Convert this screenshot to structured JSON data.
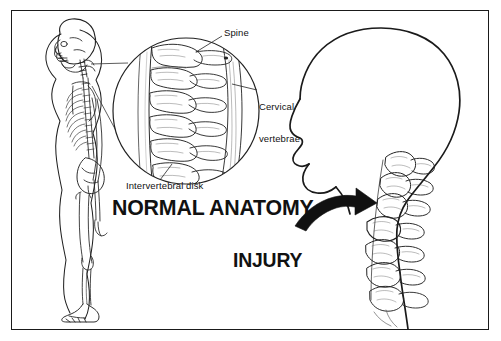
{
  "figure": {
    "background_color": "#ffffff",
    "ink_color": "#111111",
    "border_color": "#1a1a1a",
    "width": 501,
    "height": 341
  },
  "labels": {
    "spine": "Spine",
    "cervical_vertebrae_line1": "Cervical",
    "cervical_vertebrae_line2": "vertebrae",
    "intervertebral_disk": "Intervertebral disk",
    "normal_anatomy": "NORMAL ANATOMY",
    "injury": "INJURY"
  },
  "illustration_parts": {
    "skeleton_figure": "lateral-view human skeleton",
    "magnifier_circle": "magnified cervical spine detail",
    "head_profile": "lateral head and neck profile outline",
    "injured_spine": "injured cervical vertebrae",
    "arrow": "curved arrow pointing to injured vertebrae"
  }
}
